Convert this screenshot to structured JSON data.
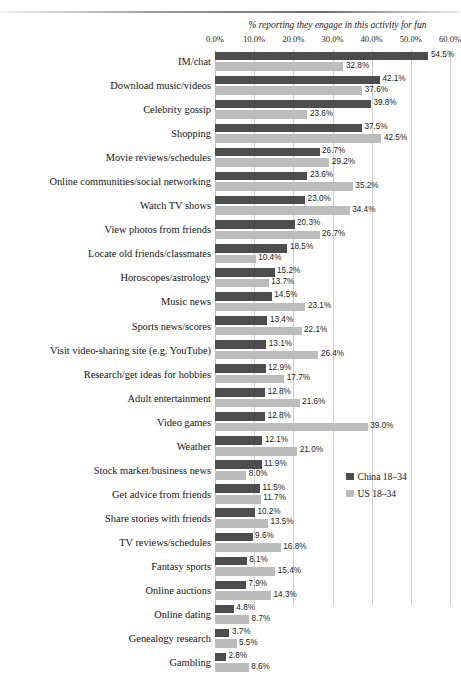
{
  "chart_data": {
    "type": "bar",
    "orientation": "horizontal",
    "title": "%  reporting they engage in this activity for fun",
    "xlabel": "",
    "ylabel": "",
    "xlim": [
      0,
      60
    ],
    "xticks": [
      "0.0%",
      "10.0%",
      "20.0%",
      "30.0%",
      "40.0%",
      "50.0%",
      "60.0%"
    ],
    "xtick_values": [
      0,
      10,
      20,
      30,
      40,
      50,
      60
    ],
    "grid": true,
    "legend_position": "right-lower",
    "categories": [
      "IM/chat",
      "Download music/videos",
      "Celebrity gossip",
      "Shopping",
      "Movie reviews/schedules",
      "Online communities/social networking",
      "Watch TV shows",
      "View photos from friends",
      "Locate old friends/classmates",
      "Horoscopes/astrology",
      "Music news",
      "Sports news/scores",
      "Visit video-sharing site (e.g. YouTube)",
      "Research/get ideas for hobbies",
      "Adult entertainment",
      "Video games",
      "Weather",
      "Stock market/business news",
      "Get advice from friends",
      "Share stories with friends",
      "TV reviews/schedules",
      "Fantasy sports",
      "Online auctions",
      "Online dating",
      "Genealogy research",
      "Gambling"
    ],
    "series": [
      {
        "name": "China 18–34",
        "color": "#4d4d4d",
        "values": [
          54.5,
          42.1,
          39.8,
          37.5,
          26.7,
          23.6,
          23.0,
          20.3,
          18.5,
          15.2,
          14.5,
          13.4,
          13.1,
          12.9,
          12.8,
          12.8,
          12.1,
          11.9,
          11.5,
          10.2,
          9.6,
          8.1,
          7.9,
          4.8,
          3.7,
          2.8
        ],
        "labels": [
          "54.5%",
          "42.1%",
          "39.8%",
          "37.5%",
          "26.7%",
          "23.6%",
          "23.0%",
          "20.3%",
          "18.5%",
          "15.2%",
          "14.5%",
          "13.4%",
          "13.1%",
          "12.9%",
          "12.8%",
          "12.8%",
          "12.1%",
          "11.9%",
          "11.5%",
          "10.2%",
          "9.6%",
          "8.1%",
          "7.9%",
          "4.8%",
          "3.7%",
          "2.8%"
        ]
      },
      {
        "name": "US 18–34",
        "color": "#bcbcbc",
        "values": [
          32.8,
          37.6,
          23.6,
          42.5,
          29.2,
          35.2,
          34.4,
          26.7,
          10.4,
          13.7,
          23.1,
          22.1,
          26.4,
          17.7,
          21.6,
          39.0,
          21.0,
          8.0,
          11.7,
          13.5,
          16.8,
          15.4,
          14.3,
          8.7,
          5.5,
          8.6
        ],
        "labels": [
          "32.8%",
          "37.6%",
          "23.6%",
          "42.5%",
          "29.2%",
          "35.2%",
          "34.4%",
          "26.7%",
          "10.4%",
          "13.7%",
          "23.1%",
          "22.1%",
          "26.4%",
          "17.7%",
          "21.6%",
          "39.0%",
          "21.0%",
          "8.0%",
          "11.7%",
          "13.5%",
          "16.8%",
          "15.4%",
          "14.3%",
          "8.7%",
          "5.5%",
          "8.6%"
        ]
      }
    ]
  }
}
